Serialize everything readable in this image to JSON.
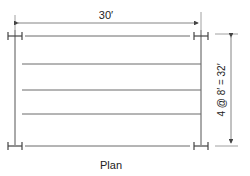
{
  "diagram": {
    "title": "Plan",
    "span_dimension": "30′",
    "spacing_dimension": "4 @ 8′ = 32′",
    "colors": {
      "line": "#555555",
      "beam": "#6a6a6a",
      "text": "#222222"
    }
  }
}
